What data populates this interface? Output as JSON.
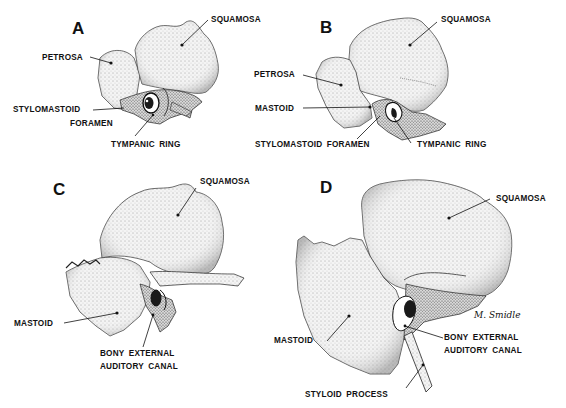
{
  "figure": {
    "panels": [
      {
        "letter": "A",
        "labels": {
          "squamosa": "SQUAMOSA",
          "petrosa": "PETROSA",
          "stylomastoid": "STYLOMASTOID",
          "foramen": "FORAMEN",
          "tympanic_ring": "TYMPANIC  RING"
        }
      },
      {
        "letter": "B",
        "labels": {
          "squamosa": "SQUAMOSA",
          "petrosa": "PETROSA",
          "mastoid": "MASTOID",
          "stylomastoid_foramen": "STYLOMASTOID  FORAMEN",
          "tympanic_ring": "TYMPANIC  RING"
        }
      },
      {
        "letter": "C",
        "labels": {
          "squamosa": "SQUAMOSA",
          "mastoid": "MASTOID",
          "canal_line1": "BONY  EXTERNAL",
          "canal_line2": "AUDITORY  CANAL"
        }
      },
      {
        "letter": "D",
        "labels": {
          "squamosa": "SQUAMOSA",
          "mastoid": "MASTOID",
          "canal_line1": "BONY  EXTERNAL",
          "canal_line2": "AUDITORY  CANAL",
          "styloid": "STYLOID  PROCESS"
        },
        "signature": "M. Smidle"
      }
    ],
    "colors": {
      "ink": "#111111",
      "paper": "#ffffff",
      "shade": "#bdbdbd",
      "light": "#ececec"
    }
  }
}
